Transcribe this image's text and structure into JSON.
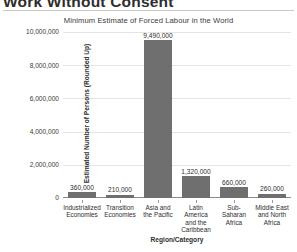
{
  "page": {
    "title": "Work Without Consent"
  },
  "chart_data": {
    "type": "bar",
    "title": "Minimum Estimate of Forced Labour in the World",
    "xlabel": "Region/Category",
    "ylabel": "Estimated Number of Persons (Rounded Up)",
    "ylim": [
      0,
      10000000
    ],
    "grid": true,
    "legend": null,
    "bar_color": "#6f6f6f",
    "categories": [
      "Industrialized Economies",
      "Transition Economies",
      "Asia and the Pacific",
      "Latin America and the Caribbean",
      "Sub-Saharan Africa",
      "Middle East and North Africa"
    ],
    "category_lines": [
      [
        "Industrialized",
        "Economies"
      ],
      [
        "Transition",
        "Economies"
      ],
      [
        "Asia and",
        "the Pacific"
      ],
      [
        "Latin",
        "America",
        "and the",
        "Caribbean"
      ],
      [
        "Sub-",
        "Saharan",
        "Africa"
      ],
      [
        "Middle East",
        "and North",
        "Africa"
      ]
    ],
    "values": [
      360000,
      210000,
      9490000,
      1320000,
      660000,
      260000
    ],
    "value_labels": [
      "360,000",
      "210,000",
      "9,490,000",
      "1,320,000",
      "660,000",
      "260,000"
    ],
    "yticks": [
      0,
      2000000,
      4000000,
      6000000,
      8000000,
      10000000
    ],
    "ytick_labels": [
      "0",
      "2,000,000",
      "4,000,000",
      "6,000,000",
      "8,000,000",
      "10,000,000"
    ]
  }
}
